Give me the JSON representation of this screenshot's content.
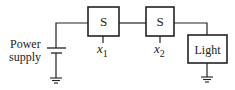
{
  "diagram": {
    "power_supply_label_line1": "Power",
    "power_supply_label_line2": "supply",
    "switch1": {
      "label": "S",
      "input_label": "x",
      "input_subscript": "1"
    },
    "switch2": {
      "label": "S",
      "input_label": "x",
      "input_subscript": "2"
    },
    "load": {
      "label": "Light"
    },
    "colors": {
      "stroke": "#222222",
      "background": "#ffffff"
    }
  }
}
